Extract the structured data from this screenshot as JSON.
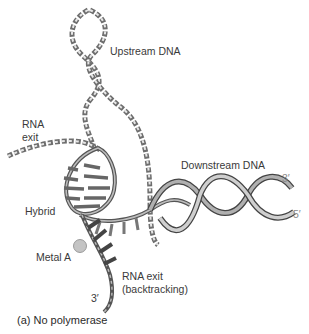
{
  "figure": {
    "caption": "(a) No polymerase",
    "labels": {
      "upstream_dna": "Upstream DNA",
      "rna_exit_line1": "RNA",
      "rna_exit_line2": "exit",
      "downstream_dna": "Downstream DNA",
      "hybrid": "Hybrid",
      "metal_a": "Metal A",
      "rna_exit_backtracking_line1": "RNA exit",
      "rna_exit_backtracking_line2": "(backtracking)",
      "three_prime_top": "3′",
      "five_prime": "5′",
      "three_prime_bottom": "3′"
    },
    "colors": {
      "strand_dark": "#555555",
      "strand_light": "#bdbdbd",
      "ribbon_fill": "#a9a9a9",
      "metal": "#c4c4c4",
      "text": "#3a3a3a"
    }
  }
}
